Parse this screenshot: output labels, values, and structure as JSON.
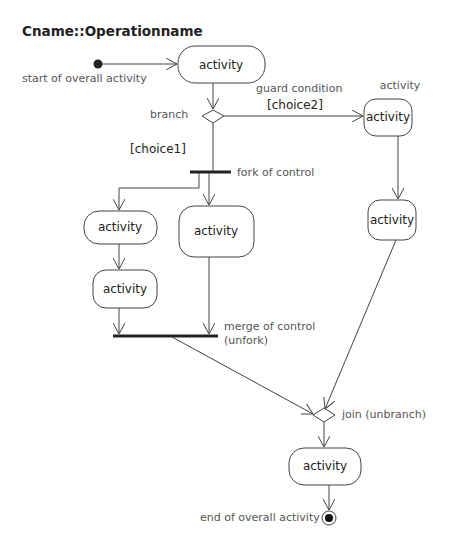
{
  "title": "Cname::Operationname",
  "nodes": {
    "start_label": "start of overall activity",
    "activity_top": "activity",
    "branch_label": "branch",
    "guard_condition_label": "guard condition",
    "choice2_label": "[choice2]",
    "right_activity_caption": "activity",
    "right_activity_1": "activity",
    "right_activity_2": "activity",
    "choice1_label": "[choice1]",
    "fork_label": "fork of control",
    "left_activity_1": "activity",
    "left_activity_2": "activity",
    "center_activity": "activity",
    "merge_label_line1": "merge of control",
    "merge_label_line2": "(unfork)",
    "join_label": "join (unbranch)",
    "bottom_activity": "activity",
    "end_label": "end of overall activity"
  },
  "colors": {
    "line": "#444444",
    "text": "#222222",
    "label": "#555555",
    "background": "#ffffff"
  }
}
